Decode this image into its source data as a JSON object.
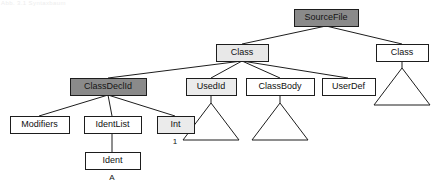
{
  "figure": {
    "watermark": "Abb. 3.1 Syntaxbaum",
    "background": "#ffffff",
    "line_color": "#1d1d1d"
  },
  "palette": {
    "white": "#ffffff",
    "light_gray": "#e8e8e8",
    "mid_gray": "#d0d0d0",
    "dark_gray": "#8a8a8a",
    "stroke": "#1d1d1d",
    "text": "#101010"
  },
  "nodes": [
    {
      "id": "sourcefile",
      "label": "SourceFile",
      "x": 294,
      "y": 9,
      "w": 64,
      "h": 17,
      "fill": "#8a8a8a",
      "shade": "dark"
    },
    {
      "id": "class-left",
      "label": "Class",
      "x": 216,
      "y": 44,
      "w": 52,
      "h": 17,
      "fill": "#e8e8e8",
      "shade": "light"
    },
    {
      "id": "class-right",
      "label": "Class",
      "x": 376,
      "y": 44,
      "w": 52,
      "h": 17,
      "fill": "#ffffff",
      "shade": "none"
    },
    {
      "id": "classdeclid",
      "label": "ClassDeclId",
      "x": 70,
      "y": 78,
      "w": 76,
      "h": 17,
      "fill": "#8a8a8a",
      "shade": "dark"
    },
    {
      "id": "usedid",
      "label": "UsedId",
      "x": 186,
      "y": 78,
      "w": 50,
      "h": 17,
      "fill": "#ebebeb",
      "shade": "light"
    },
    {
      "id": "classbody",
      "label": "ClassBody",
      "x": 246,
      "y": 78,
      "w": 68,
      "h": 17,
      "fill": "#ffffff",
      "shade": "none"
    },
    {
      "id": "userdef",
      "label": "UserDef",
      "x": 322,
      "y": 78,
      "w": 53,
      "h": 17,
      "fill": "#ffffff",
      "shade": "none"
    },
    {
      "id": "modifiers",
      "label": "Modifiers",
      "x": 10,
      "y": 116,
      "w": 59,
      "h": 17,
      "fill": "#ffffff",
      "shade": "none"
    },
    {
      "id": "identlist",
      "label": "IdentList",
      "x": 84,
      "y": 116,
      "w": 57,
      "h": 17,
      "fill": "#ffffff",
      "shade": "none"
    },
    {
      "id": "int",
      "label": "Int",
      "x": 157,
      "y": 116,
      "w": 37,
      "h": 17,
      "fill": "#ebebeb",
      "shade": "light"
    },
    {
      "id": "ident",
      "label": "Ident",
      "x": 85,
      "y": 152,
      "w": 55,
      "h": 17,
      "fill": "#ffffff",
      "shade": "none"
    }
  ],
  "edges": [
    {
      "id": "sourcefile-class-left",
      "from": "sourcefile",
      "to": "class-left",
      "x1": 326,
      "y1": 26,
      "x2": 242,
      "y2": 44
    },
    {
      "id": "sourcefile-class-right",
      "from": "sourcefile",
      "to": "class-right",
      "x1": 326,
      "y1": 26,
      "x2": 402,
      "y2": 44
    },
    {
      "id": "class-left-classdeclid",
      "from": "class-left",
      "to": "classdeclid",
      "x1": 242,
      "y1": 61,
      "x2": 108,
      "y2": 78
    },
    {
      "id": "class-left-usedid",
      "from": "class-left",
      "to": "usedid",
      "x1": 242,
      "y1": 61,
      "x2": 211,
      "y2": 78
    },
    {
      "id": "class-left-classbody",
      "from": "class-left",
      "to": "classbody",
      "x1": 242,
      "y1": 61,
      "x2": 280,
      "y2": 78
    },
    {
      "id": "class-left-userdef",
      "from": "class-left",
      "to": "userdef",
      "x1": 242,
      "y1": 61,
      "x2": 348,
      "y2": 78
    },
    {
      "id": "classdeclid-modifiers",
      "from": "classdeclid",
      "to": "modifiers",
      "x1": 108,
      "y1": 95,
      "x2": 39,
      "y2": 116
    },
    {
      "id": "classdeclid-identlist",
      "from": "classdeclid",
      "to": "identlist",
      "x1": 108,
      "y1": 95,
      "x2": 112,
      "y2": 116
    },
    {
      "id": "classdeclid-int",
      "from": "classdeclid",
      "to": "int",
      "x1": 108,
      "y1": 95,
      "x2": 175,
      "y2": 116
    },
    {
      "id": "identlist-ident",
      "from": "identlist",
      "to": "ident",
      "x1": 112,
      "y1": 133,
      "x2": 112,
      "y2": 152
    },
    {
      "id": "usedid-subtree",
      "from": "usedid",
      "to": "tri-usedid",
      "x1": 211,
      "y1": 95,
      "x2": 211,
      "y2": 103
    },
    {
      "id": "classbody-subtree",
      "from": "classbody",
      "to": "tri-classbody",
      "x1": 280,
      "y1": 95,
      "x2": 280,
      "y2": 103
    },
    {
      "id": "class-right-subtree",
      "from": "class-right",
      "to": "tri-class-right",
      "x1": 402,
      "y1": 61,
      "x2": 402,
      "y2": 68
    }
  ],
  "subtrees": [
    {
      "id": "tri-usedid",
      "apex_x": 211,
      "apex_y": 103,
      "half_width": 28,
      "height": 37
    },
    {
      "id": "tri-classbody",
      "apex_x": 280,
      "apex_y": 103,
      "half_width": 28,
      "height": 37
    },
    {
      "id": "tri-class-right",
      "apex_x": 402,
      "apex_y": 68,
      "half_width": 28,
      "height": 37
    }
  ],
  "leaf_values": [
    {
      "id": "int-value",
      "text": "1",
      "x": 175,
      "y": 142,
      "belongs_to": "int"
    },
    {
      "id": "ident-value",
      "text": "A",
      "x": 112,
      "y": 178,
      "belongs_to": "ident"
    }
  ]
}
